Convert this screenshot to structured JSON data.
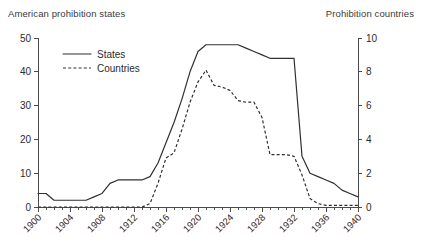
{
  "left_axis_title": "American prohibition states",
  "right_axis_title": "Prohibition countries",
  "legend": {
    "states_label": "States",
    "countries_label": "Countries"
  },
  "colors": {
    "line": "#303030",
    "axis": "#4a4a4a",
    "text": "#2b2b2b",
    "background": "#ffffff"
  },
  "chart_data": {
    "type": "line",
    "title": "",
    "subtitle": "",
    "xlabel": "",
    "ylabel": "American prohibition states",
    "y2label": "Prohibition countries",
    "xlim": [
      1900,
      1940
    ],
    "ylim": [
      0,
      50
    ],
    "y2lim": [
      0,
      10
    ],
    "yticks": [
      0,
      10,
      20,
      30,
      40,
      50
    ],
    "y2ticks": [
      0,
      2,
      4,
      6,
      8,
      10
    ],
    "xticks": [
      1900,
      1904,
      1908,
      1912,
      1916,
      1920,
      1924,
      1928,
      1932,
      1936,
      1940
    ],
    "xticklabels": [
      "1900",
      "1904",
      "1908",
      "1912",
      "1916",
      "1920",
      "1924",
      "1928",
      "1932",
      "1936",
      "1940"
    ],
    "xtick_minor_step": 1,
    "xticklabel_rotation": 45,
    "grid": false,
    "legend_position": "upper-left-inside",
    "x": [
      1900,
      1901,
      1902,
      1903,
      1904,
      1905,
      1906,
      1907,
      1908,
      1909,
      1910,
      1911,
      1912,
      1913,
      1914,
      1915,
      1916,
      1917,
      1918,
      1919,
      1920,
      1921,
      1922,
      1923,
      1924,
      1925,
      1926,
      1927,
      1928,
      1929,
      1930,
      1931,
      1932,
      1933,
      1934,
      1935,
      1936,
      1937,
      1938,
      1939,
      1940
    ],
    "series": [
      {
        "name": "States",
        "axis": "left",
        "style": "solid",
        "values": [
          4,
          4,
          2,
          2,
          2,
          2,
          2,
          3,
          4,
          7,
          8,
          8,
          8,
          8,
          9,
          13,
          19,
          25,
          32,
          40,
          46,
          48,
          48,
          48,
          48,
          48,
          47,
          46,
          45,
          44,
          44,
          44,
          44,
          15,
          10,
          9,
          8,
          7,
          5,
          4,
          3
        ]
      },
      {
        "name": "Countries",
        "axis": "right",
        "style": "dashed",
        "values": [
          0,
          0,
          0,
          0,
          0,
          0,
          0,
          0,
          0,
          0,
          0,
          0,
          0,
          0,
          0.2,
          1.4,
          2.9,
          3.2,
          4.6,
          6.2,
          7.4,
          8.1,
          7.2,
          7.1,
          6.9,
          6.3,
          6.2,
          6.2,
          5.3,
          3.1,
          3.1,
          3.1,
          3.0,
          1.9,
          0.5,
          0.2,
          0.1,
          0.1,
          0.1,
          0.1,
          0.1
        ]
      }
    ]
  }
}
